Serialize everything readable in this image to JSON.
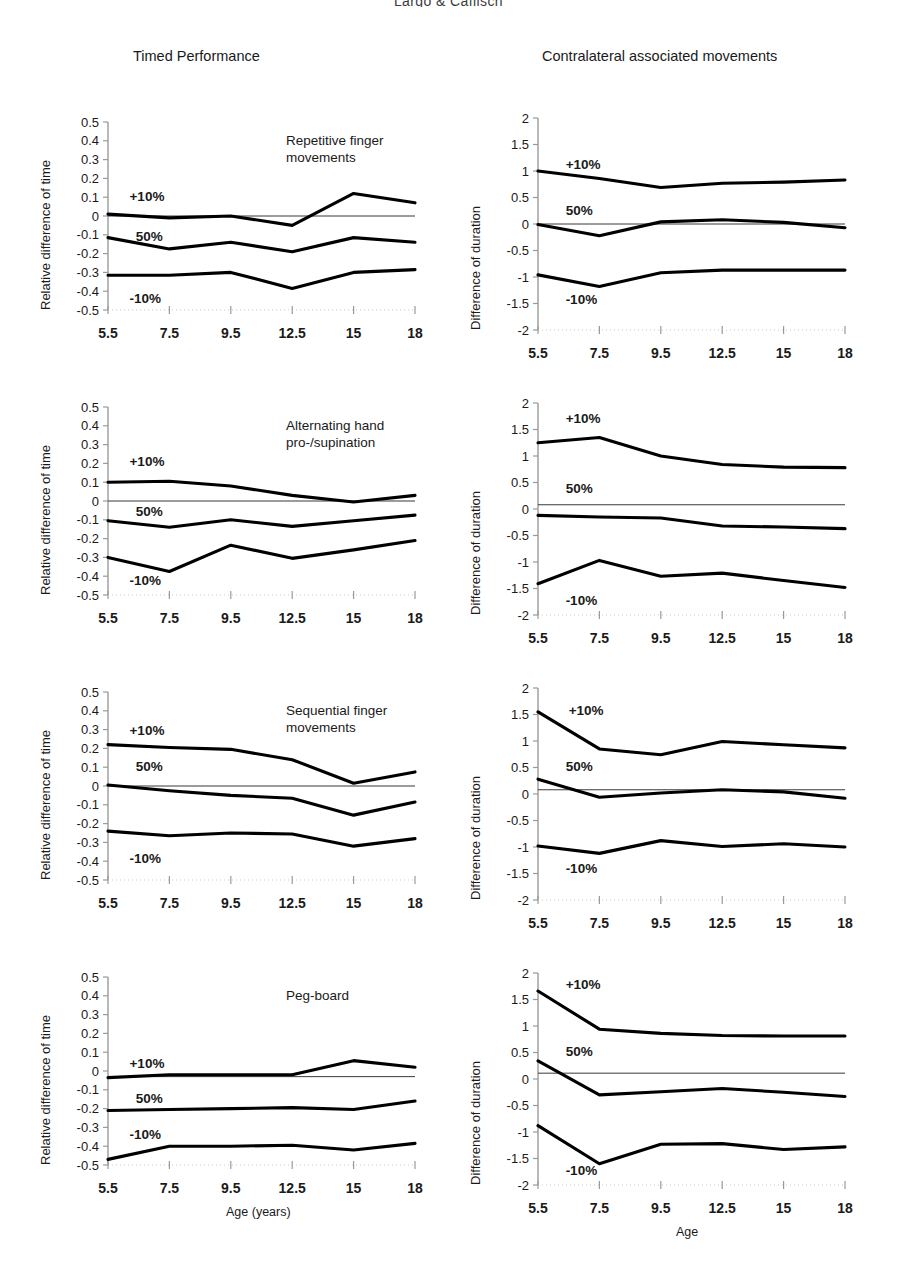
{
  "running_head": "Largo & Caflisch",
  "columns": {
    "left_heading": "Timed Performance",
    "right_heading": "Contralateral associated movements"
  },
  "axis_captions": {
    "left": "Age (years)",
    "right": "Age"
  },
  "series_labels": {
    "upper": "+10%",
    "middle": "50%",
    "lower": "-10%"
  },
  "chart_data": [
    {
      "id": "repetitive-finger-movements-timed",
      "type": "line",
      "title": "Repetitive finger\nmovements",
      "column": "Timed Performance",
      "xlabel": "Age (years)",
      "ylabel": "Relative difference of time",
      "categories": [
        "5.5",
        "7.5",
        "9.5",
        "12.5",
        "15",
        "18"
      ],
      "x": [
        5.5,
        7.5,
        9.5,
        12.5,
        15,
        18
      ],
      "ylim": [
        -0.5,
        0.5
      ],
      "yticks": [
        "0.5",
        "0.4",
        "0.3",
        "0.2",
        "0.1",
        "0",
        "-0.1",
        "-0.2",
        "-0.3",
        "-0.4",
        "-0.5"
      ],
      "grid": false,
      "zero_line": 0,
      "series": [
        {
          "name": "+10%",
          "values": [
            0.01,
            -0.01,
            0.0,
            -0.05,
            0.12,
            0.07
          ]
        },
        {
          "name": "50%",
          "values": [
            -0.115,
            -0.175,
            -0.14,
            -0.19,
            -0.115,
            -0.14
          ]
        },
        {
          "name": "-10%",
          "values": [
            -0.315,
            -0.315,
            -0.3,
            -0.385,
            -0.3,
            -0.285
          ]
        }
      ],
      "annotations": [
        {
          "text": "+10%",
          "x": 6.2,
          "y": 0.105
        },
        {
          "text": "50%",
          "x": 6.4,
          "y": -0.105
        },
        {
          "text": "-10%",
          "x": 6.2,
          "y": -0.435
        }
      ]
    },
    {
      "id": "repetitive-finger-movements-contralateral",
      "type": "line",
      "title": "",
      "column": "Contralateral associated movements",
      "xlabel": "Age",
      "ylabel": "Difference of duration",
      "categories": [
        "5.5",
        "7.5",
        "9.5",
        "12.5",
        "15",
        "18"
      ],
      "x": [
        5.5,
        7.5,
        9.5,
        12.5,
        15,
        18
      ],
      "ylim": [
        -2,
        2
      ],
      "yticks": [
        "2",
        "1.5",
        "1",
        "0.5",
        "0",
        "-0.5",
        "-1",
        "-1.5",
        "-2"
      ],
      "grid": false,
      "zero_line": 0,
      "series": [
        {
          "name": "+10%",
          "values": [
            1.0,
            0.86,
            0.69,
            0.77,
            0.79,
            0.83
          ]
        },
        {
          "name": "50%",
          "values": [
            -0.01,
            -0.22,
            0.04,
            0.08,
            0.03,
            -0.07
          ]
        },
        {
          "name": "-10%",
          "values": [
            -0.96,
            -1.18,
            -0.92,
            -0.87,
            -0.87,
            -0.87
          ]
        }
      ],
      "annotations": [
        {
          "text": "+10%",
          "x": 6.4,
          "y": 1.14
        },
        {
          "text": "50%",
          "x": 6.4,
          "y": 0.27
        },
        {
          "text": "-10%",
          "x": 6.4,
          "y": -1.42
        }
      ]
    },
    {
      "id": "alternating-hand-pro-supination-timed",
      "type": "line",
      "title": "Alternating hand\npro-/supination",
      "column": "Timed Performance",
      "xlabel": "Age (years)",
      "ylabel": "Relative difference of time",
      "categories": [
        "5.5",
        "7.5",
        "9.5",
        "12.5",
        "15",
        "18"
      ],
      "x": [
        5.5,
        7.5,
        9.5,
        12.5,
        15,
        18
      ],
      "ylim": [
        -0.5,
        0.5
      ],
      "yticks": [
        "0.5",
        "0.4",
        "0.3",
        "0.2",
        "0.1",
        "0",
        "-0.1",
        "-0.2",
        "-0.3",
        "-0.4",
        "-0.5"
      ],
      "grid": false,
      "zero_line": 0,
      "series": [
        {
          "name": "+10%",
          "values": [
            0.1,
            0.105,
            0.08,
            0.03,
            -0.005,
            0.03
          ]
        },
        {
          "name": "50%",
          "values": [
            -0.105,
            -0.14,
            -0.1,
            -0.135,
            -0.105,
            -0.075
          ]
        },
        {
          "name": "-10%",
          "values": [
            -0.3,
            -0.375,
            -0.235,
            -0.305,
            -0.26,
            -0.21
          ]
        }
      ],
      "annotations": [
        {
          "text": "+10%",
          "x": 6.2,
          "y": 0.215
        },
        {
          "text": "50%",
          "x": 6.4,
          "y": -0.055
        },
        {
          "text": "-10%",
          "x": 6.2,
          "y": -0.42
        }
      ]
    },
    {
      "id": "alternating-hand-pro-supination-contralateral",
      "type": "line",
      "title": "",
      "column": "Contralateral associated movements",
      "xlabel": "Age",
      "ylabel": "Difference of duration",
      "categories": [
        "5.5",
        "7.5",
        "9.5",
        "12.5",
        "15",
        "18"
      ],
      "x": [
        5.5,
        7.5,
        9.5,
        12.5,
        15,
        18
      ],
      "ylim": [
        -2,
        2
      ],
      "yticks": [
        "2",
        "1.5",
        "1",
        "0.5",
        "0",
        "-0.5",
        "-1",
        "-1.5",
        "-2"
      ],
      "grid": false,
      "zero_line": 0.08,
      "series": [
        {
          "name": "+10%",
          "values": [
            1.25,
            1.35,
            1.0,
            0.84,
            0.79,
            0.78
          ]
        },
        {
          "name": "50%",
          "values": [
            -0.12,
            -0.15,
            -0.17,
            -0.32,
            -0.34,
            -0.37
          ]
        },
        {
          "name": "-10%",
          "values": [
            -1.41,
            -0.97,
            -1.27,
            -1.21,
            -1.35,
            -1.48
          ]
        }
      ],
      "annotations": [
        {
          "text": "+10%",
          "x": 6.4,
          "y": 1.72
        },
        {
          "text": "50%",
          "x": 6.4,
          "y": 0.4
        },
        {
          "text": "-10%",
          "x": 6.4,
          "y": -1.72
        }
      ]
    },
    {
      "id": "sequential-finger-movements-timed",
      "type": "line",
      "title": "Sequential finger\nmovements",
      "column": "Timed Performance",
      "xlabel": "Age (years)",
      "ylabel": "Relative difference of time",
      "categories": [
        "5.5",
        "7.5",
        "9.5",
        "12.5",
        "15",
        "18"
      ],
      "x": [
        5.5,
        7.5,
        9.5,
        12.5,
        15,
        18
      ],
      "ylim": [
        -0.5,
        0.5
      ],
      "yticks": [
        "0.5",
        "0.4",
        "0.3",
        "0.2",
        "0.1",
        "0",
        "-0.1",
        "-0.2",
        "-0.3",
        "-0.4",
        "-0.5"
      ],
      "grid": false,
      "zero_line": 0,
      "series": [
        {
          "name": "+10%",
          "values": [
            0.22,
            0.205,
            0.195,
            0.14,
            0.015,
            0.075
          ]
        },
        {
          "name": "50%",
          "values": [
            0.005,
            -0.025,
            -0.05,
            -0.065,
            -0.155,
            -0.085
          ]
        },
        {
          "name": "-10%",
          "values": [
            -0.24,
            -0.265,
            -0.25,
            -0.255,
            -0.32,
            -0.28
          ]
        }
      ],
      "annotations": [
        {
          "text": "+10%",
          "x": 6.2,
          "y": 0.3
        },
        {
          "text": "50%",
          "x": 6.4,
          "y": 0.105
        },
        {
          "text": "-10%",
          "x": 6.2,
          "y": -0.385
        }
      ]
    },
    {
      "id": "sequential-finger-movements-contralateral",
      "type": "line",
      "title": "",
      "column": "Contralateral associated movements",
      "xlabel": "Age",
      "ylabel": "Difference of duration",
      "categories": [
        "5.5",
        "7.5",
        "9.5",
        "12.5",
        "15",
        "18"
      ],
      "x": [
        5.5,
        7.5,
        9.5,
        12.5,
        15,
        18
      ],
      "ylim": [
        -2,
        2
      ],
      "yticks": [
        "2",
        "1.5",
        "1",
        "0.5",
        "0",
        "-0.5",
        "-1",
        "-1.5",
        "-2"
      ],
      "grid": false,
      "zero_line": 0.08,
      "series": [
        {
          "name": "+10%",
          "values": [
            1.55,
            0.85,
            0.74,
            0.99,
            0.93,
            0.87
          ]
        },
        {
          "name": "50%",
          "values": [
            0.28,
            -0.06,
            0.02,
            0.08,
            0.04,
            -0.08
          ]
        },
        {
          "name": "-10%",
          "values": [
            -0.98,
            -1.12,
            -0.88,
            -0.99,
            -0.94,
            -1.0
          ]
        }
      ],
      "annotations": [
        {
          "text": "+10%",
          "x": 6.5,
          "y": 1.58
        },
        {
          "text": "50%",
          "x": 6.4,
          "y": 0.52
        },
        {
          "text": "-10%",
          "x": 6.4,
          "y": -1.4
        }
      ]
    },
    {
      "id": "peg-board-timed",
      "type": "line",
      "title": "Peg-board",
      "column": "Timed Performance",
      "xlabel": "Age (years)",
      "ylabel": "Relative difference of time",
      "categories": [
        "5.5",
        "7.5",
        "9.5",
        "12.5",
        "15",
        "18"
      ],
      "x": [
        5.5,
        7.5,
        9.5,
        12.5,
        15,
        18
      ],
      "ylim": [
        -0.5,
        0.5
      ],
      "yticks": [
        "0.5",
        "0.4",
        "0.3",
        "0.2",
        "0.1",
        "0",
        "-0.1",
        "-0.2",
        "-0.3",
        "-0.4",
        "-0.5"
      ],
      "grid": false,
      "zero_line": -0.03,
      "series": [
        {
          "name": "+10%",
          "values": [
            -0.035,
            -0.02,
            -0.02,
            -0.02,
            0.055,
            0.02
          ]
        },
        {
          "name": "50%",
          "values": [
            -0.21,
            -0.205,
            -0.2,
            -0.195,
            -0.205,
            -0.16
          ]
        },
        {
          "name": "-10%",
          "values": [
            -0.47,
            -0.4,
            -0.4,
            -0.395,
            -0.42,
            -0.385
          ]
        }
      ],
      "annotations": [
        {
          "text": "+10%",
          "x": 6.2,
          "y": 0.045
        },
        {
          "text": "50%",
          "x": 6.4,
          "y": -0.145
        },
        {
          "text": "-10%",
          "x": 6.2,
          "y": -0.335
        }
      ]
    },
    {
      "id": "peg-board-contralateral",
      "type": "line",
      "title": "",
      "column": "Contralateral associated movements",
      "xlabel": "Age",
      "ylabel": "Difference of duration",
      "categories": [
        "5.5",
        "7.5",
        "9.5",
        "12.5",
        "15",
        "18"
      ],
      "x": [
        5.5,
        7.5,
        9.5,
        12.5,
        15,
        18
      ],
      "ylim": [
        -2,
        2
      ],
      "yticks": [
        "2",
        "1.5",
        "1",
        "0.5",
        "0",
        "-0.5",
        "-1",
        "-1.5",
        "-2"
      ],
      "grid": false,
      "zero_line": 0.11,
      "series": [
        {
          "name": "+10%",
          "values": [
            1.66,
            0.94,
            0.86,
            0.82,
            0.81,
            0.81
          ]
        },
        {
          "name": "50%",
          "values": [
            0.34,
            -0.3,
            -0.24,
            -0.18,
            -0.25,
            -0.33
          ]
        },
        {
          "name": "-10%",
          "values": [
            -0.88,
            -1.6,
            -1.23,
            -1.22,
            -1.33,
            -1.28
          ]
        }
      ],
      "annotations": [
        {
          "text": "+10%",
          "x": 6.4,
          "y": 1.8
        },
        {
          "text": "50%",
          "x": 6.4,
          "y": 0.52
        },
        {
          "text": "-10%",
          "x": 6.4,
          "y": -1.72
        }
      ]
    }
  ]
}
